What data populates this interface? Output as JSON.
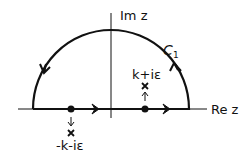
{
  "diagram": {
    "axes": {
      "imaginary_label": "Im z",
      "real_label": "Re z"
    },
    "contour": {
      "label": "C",
      "label_subscript": "1",
      "shape": "upper semicircle closed by real axis",
      "orientation": "counterclockwise"
    },
    "poles": [
      {
        "label": "k+iε",
        "position": "right of origin, shifted up",
        "shift_direction": "up"
      },
      {
        "label": "-k-iε",
        "position": "left of origin, shifted down",
        "shift_direction": "down"
      }
    ],
    "colors": {
      "stroke": "#111111",
      "background": "#ffffff"
    }
  }
}
